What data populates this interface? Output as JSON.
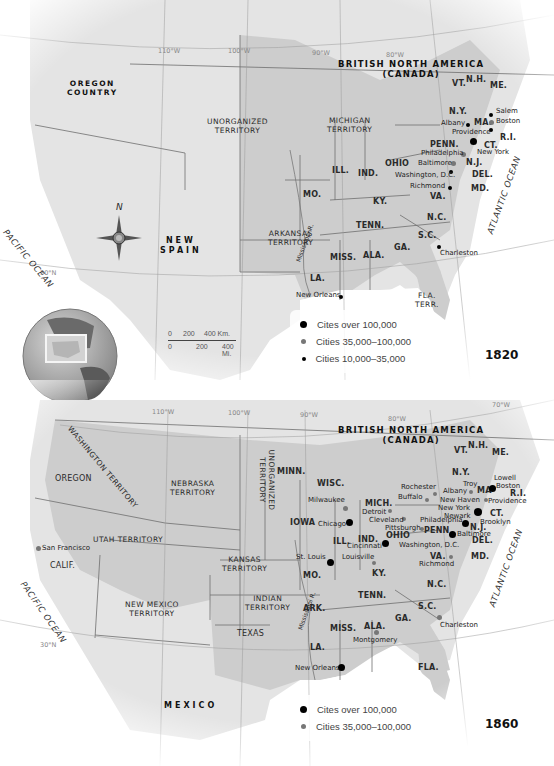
{
  "colors": {
    "land": "#e6e6e6",
    "states": "#cfcfcf",
    "water": "#ffffff",
    "border": "#6f6f6f",
    "city_large": "#000000",
    "city_medium": "#7a7a7a",
    "city_small": "#000000"
  },
  "map_1820": {
    "year": "1820",
    "coordinates": [
      "110°W",
      "100°W",
      "90°W",
      "80°W",
      "30°N"
    ],
    "foreign": {
      "canada_line1": "BRITISH NORTH AMERICA",
      "canada_line2": "(CANADA)",
      "spain_line1": "NEW",
      "spain_line2": "SPAIN"
    },
    "territories": {
      "oregon_line1": "OREGON",
      "oregon_line2": "COUNTRY",
      "unorganized_line1": "UNORGANIZED",
      "unorganized_line2": "TERRITORY",
      "michigan_line1": "MICHIGAN",
      "michigan_line2": "TERRITORY",
      "arkansas_line1": "ARKANSAS",
      "arkansas_line2": "TERRITORY",
      "florida_line1": "FLA.",
      "florida_line2": "TERR."
    },
    "states": {
      "vt": "VT.",
      "nh": "N.H.",
      "me": "ME.",
      "ny": "N.Y.",
      "ma": "MA.",
      "ri": "R.I.",
      "ct": "CT.",
      "penn": "PENN.",
      "nj": "N.J.",
      "del": "DEL.",
      "md": "MD.",
      "va": "VA.",
      "nc": "N.C.",
      "sc": "S.C.",
      "ga": "GA.",
      "ala": "ALA.",
      "miss": "MISS.",
      "la": "LA.",
      "tenn": "TENN.",
      "ky": "KY.",
      "ohio": "OHIO",
      "ind": "IND.",
      "ill": "ILL.",
      "mo": "MO."
    },
    "cities": {
      "salem": "Salem",
      "boston": "Boston",
      "albany": "Albany",
      "providence": "Providence",
      "new_york": "New York",
      "philadelphia": "Philadelphia",
      "baltimore": "Baltimore",
      "washington": "Washington, D.C.",
      "richmond": "Richmond",
      "charleston": "Charleston",
      "new_orleans": "New Orleans"
    },
    "river": "Mississippi R.",
    "oceans": {
      "pacific": "PACIFIC OCEAN",
      "atlantic": "ATLANTIC OCEAN"
    },
    "compass": "N",
    "scale": {
      "km_labels": [
        "0",
        "200",
        "400 Km."
      ],
      "mi_labels": [
        "0",
        "200",
        "400 Mi."
      ]
    },
    "legend": [
      {
        "marker": "large",
        "label": "Cites over 100,000"
      },
      {
        "marker": "medium",
        "label": "Cities 35,000–100,000"
      },
      {
        "marker": "small",
        "label": "Cities 10,000–35,000"
      }
    ]
  },
  "map_1860": {
    "year": "1860",
    "coordinates": [
      "110°W",
      "100°W",
      "90°W",
      "80°W",
      "70°W",
      "30°N"
    ],
    "foreign": {
      "canada_line1": "BRITISH NORTH AMERICA",
      "canada_line2": "(CANADA)",
      "mexico": "MEXICO"
    },
    "territories": {
      "washington": "WASHINGTON TERRITORY",
      "nebraska_line1": "NEBRASKA",
      "nebraska_line2": "TERRITORY",
      "unorganized_line1": "UNORGANIZED",
      "unorganized_line2": "TERRITORY",
      "utah": "UTAH TERRITORY",
      "kansas_line1": "KANSAS",
      "kansas_line2": "TERRITORY",
      "new_mexico_line1": "NEW MEXICO",
      "new_mexico_line2": "TERRITORY",
      "indian_line1": "INDIAN",
      "indian_line2": "TERRITORY"
    },
    "states": {
      "oregon": "OREGON",
      "calif": "CALIF.",
      "texas": "TEXAS",
      "minn": "MINN.",
      "wisc": "WISC.",
      "iowa": "IOWA",
      "mich": "MICH.",
      "ill": "ILL.",
      "ind": "IND.",
      "ohio": "OHIO",
      "mo": "MO.",
      "ky": "KY.",
      "ark": "ARK.",
      "tenn": "TENN.",
      "miss": "MISS.",
      "ala": "ALA.",
      "ga": "GA.",
      "la": "LA.",
      "fla": "FLA.",
      "sc": "S.C.",
      "nc": "N.C.",
      "va": "VA.",
      "md": "MD.",
      "del": "DEL.",
      "nj": "N.J.",
      "penn": "PENN",
      "ny": "N.Y.",
      "vt": "VT.",
      "nh": "N.H.",
      "me": "ME.",
      "ma": "MA",
      "ri": "R.I.",
      "ct": "CT."
    },
    "cities": {
      "san_francisco": "San Francisco",
      "milwaukee": "Milwaukee",
      "chicago": "Chicago",
      "detroit": "Detroit",
      "cleveland": "Cleveland",
      "pittsburgh": "Pittsburgh",
      "rochester": "Rochester",
      "buffalo": "Buffalo",
      "troy": "Troy",
      "albany": "Albany",
      "lowell": "Lowell",
      "boston": "Boston",
      "providence": "Providence",
      "new_haven": "New Haven",
      "new_york": "New York",
      "newark": "Newark",
      "brooklyn": "Brooklyn",
      "philadelphia": "Philadelphia",
      "baltimore": "Baltimore",
      "washington": "Washington, D.C.",
      "richmond": "Richmond",
      "cincinnati": "Cincinnati",
      "louisville": "Louisville",
      "st_louis": "St. Louis",
      "charleston": "Charleston",
      "montgomery": "Montgomery",
      "new_orleans": "New Orleans"
    },
    "river": "Mississippi R.",
    "oceans": {
      "pacific": "PACIFIC OCEAN",
      "atlantic": "ATLANTIC OCEAN"
    },
    "legend": [
      {
        "marker": "large",
        "label": "Cites over 100,000"
      },
      {
        "marker": "medium",
        "label": "Cities 35,000–100,000"
      }
    ]
  }
}
